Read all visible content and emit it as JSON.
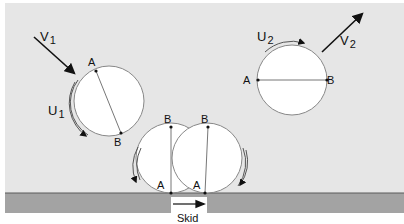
{
  "colors": {
    "background": "#e6e6e6",
    "page": "#ffffff",
    "ground": "#a3a3a3",
    "ground_edge": "#5a5a5a",
    "circle_fill": "#ffffff",
    "circle_stroke": "#888888",
    "ink": "#111111"
  },
  "labels": {
    "v1": {
      "base": "V",
      "sub": "1"
    },
    "u1": {
      "base": "U",
      "sub": "1"
    },
    "v2": {
      "base": "V",
      "sub": "2"
    },
    "u2": {
      "base": "U",
      "sub": "2"
    },
    "point_a": "A",
    "point_b": "B",
    "skid": "Skid"
  },
  "wheels": [
    {
      "name": "incoming-wheel",
      "cx": 109,
      "cy": 101,
      "r": 35,
      "a": [
        96,
        71
      ],
      "b": [
        121,
        133
      ]
    },
    {
      "name": "outgoing-wheel",
      "cx": 292,
      "cy": 80,
      "r": 35,
      "a": [
        258,
        80
      ],
      "b": [
        327,
        80
      ]
    },
    {
      "name": "contact-wheel-start",
      "cx": 171,
      "cy": 158,
      "r": 35,
      "a": [
        171,
        193
      ],
      "b": [
        171,
        127
      ]
    },
    {
      "name": "contact-wheel-end",
      "cx": 207,
      "cy": 158,
      "r": 35,
      "a": [
        205,
        193
      ],
      "b": [
        208,
        127
      ]
    }
  ]
}
